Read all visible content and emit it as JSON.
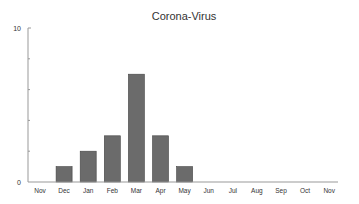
{
  "chart_data": {
    "type": "bar",
    "title": "Corona-Virus",
    "xlabel": "",
    "ylabel": "",
    "categories": [
      "Nov",
      "Dec",
      "Jan",
      "Feb",
      "Mar",
      "Apr",
      "May",
      "Jun",
      "Jul",
      "Aug",
      "Sep",
      "Oct",
      "Nov"
    ],
    "values": [
      0,
      1,
      2,
      3,
      7,
      3,
      1,
      0,
      0,
      0,
      0,
      0,
      0
    ],
    "ylim": [
      0,
      10
    ],
    "y_tick_labels": [
      "0",
      "10"
    ],
    "y_minor_ticks": [
      2,
      4,
      6,
      8
    ],
    "grid": false,
    "legend": null,
    "colors": {
      "bar": "#6b6b6b",
      "bar_border": "#444444",
      "axis": "#999999"
    }
  }
}
